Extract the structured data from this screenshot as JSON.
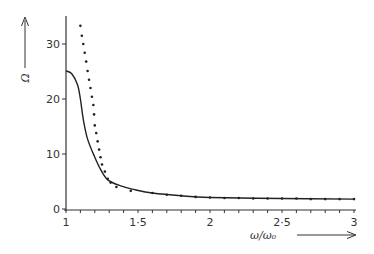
{
  "chart_data": {
    "type": "line",
    "title": "",
    "xlabel": "ω/ω₀",
    "ylabel": "Ω",
    "xlim": [
      1,
      3
    ],
    "ylim": [
      0,
      35
    ],
    "grid": false,
    "legend": null,
    "x_ticks": [
      {
        "value": 1,
        "label": "1"
      },
      {
        "value": 1.5,
        "label": "1·5"
      },
      {
        "value": 2,
        "label": "2"
      },
      {
        "value": 2.5,
        "label": "2·5"
      },
      {
        "value": 3,
        "label": "3"
      }
    ],
    "x_minor_tick_step": 0.1,
    "y_ticks": [
      {
        "value": 0,
        "label": "0"
      },
      {
        "value": 10,
        "label": "10"
      },
      {
        "value": 20,
        "label": "20"
      },
      {
        "value": 30,
        "label": "30"
      }
    ],
    "series": [
      {
        "name": "solid curve",
        "style": "solid",
        "x": [
          1.0,
          1.04,
          1.08,
          1.1,
          1.12,
          1.15,
          1.2,
          1.24,
          1.29,
          1.38,
          1.48,
          1.6,
          1.8,
          2.0,
          2.5,
          3.0
        ],
        "y": [
          25.1,
          24.6,
          22.6,
          20.0,
          16.3,
          12.7,
          9.4,
          7.2,
          5.3,
          4.2,
          3.5,
          2.9,
          2.4,
          2.1,
          1.9,
          1.8
        ]
      },
      {
        "name": "dotted curve",
        "style": "dotted",
        "x": [
          1.1,
          1.11,
          1.12,
          1.13,
          1.14,
          1.15,
          1.16,
          1.17,
          1.18,
          1.19,
          1.195,
          1.2,
          1.21,
          1.22,
          1.23,
          1.24,
          1.25,
          1.27,
          1.29,
          1.31,
          1.35,
          1.45,
          1.6,
          1.7,
          1.8,
          1.9,
          2.0,
          2.1,
          2.2,
          2.3,
          2.4,
          2.5,
          2.6,
          2.7,
          2.8,
          2.9,
          3.0
        ],
        "y": [
          33.3,
          31.5,
          30.0,
          28.4,
          26.8,
          25.1,
          23.5,
          22.0,
          20.4,
          18.9,
          17.2,
          15.2,
          13.8,
          12.3,
          10.8,
          9.4,
          8.1,
          6.8,
          5.5,
          4.8,
          4.0,
          3.3,
          2.9,
          2.6,
          2.4,
          2.2,
          2.1,
          2.0,
          2.0,
          1.9,
          1.9,
          1.9,
          1.9,
          1.8,
          1.8,
          1.8,
          1.8
        ]
      }
    ]
  },
  "plot": {
    "x_axis_px": [
      66,
      354
    ],
    "y_axis_px": [
      209,
      44
    ]
  }
}
